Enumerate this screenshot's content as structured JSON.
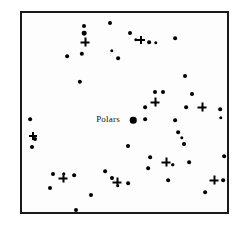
{
  "figure": {
    "background_color": "#ffffff",
    "frame_color": "#1a1a1a",
    "marker_color": "#000000"
  },
  "annotations": [
    {
      "text": "Polars",
      "x": 106,
      "y": 117
    }
  ],
  "chart_data": {
    "type": "scatter",
    "title": "",
    "subtitle": "",
    "xlabel": "",
    "ylabel": "",
    "grid": false,
    "legend_position": "none",
    "axis_ticks": false,
    "xlim": [
      0,
      209
    ],
    "ylim": [
      0,
      203
    ],
    "annotations": [
      {
        "text": "Polars",
        "x": 86,
        "y": 106,
        "target_x": 111,
        "target_y": 107
      }
    ],
    "series": [
      {
        "name": "dot-stars",
        "marker": "dot",
        "color": "#000000",
        "points": [
          {
            "x": 62,
            "y": 13,
            "size": 2.6
          },
          {
            "x": 62,
            "y": 20,
            "size": 3.0
          },
          {
            "x": 88,
            "y": 10,
            "size": 2.6
          },
          {
            "x": 108,
            "y": 20,
            "size": 2.6
          },
          {
            "x": 114,
            "y": 27,
            "size": 2.2
          },
          {
            "x": 127,
            "y": 29,
            "size": 2.4
          },
          {
            "x": 134,
            "y": 30,
            "size": 2.2
          },
          {
            "x": 153,
            "y": 25,
            "size": 2.4
          },
          {
            "x": 45,
            "y": 43,
            "size": 2.4
          },
          {
            "x": 60,
            "y": 41,
            "size": 2.8
          },
          {
            "x": 90,
            "y": 38,
            "size": 2.2
          },
          {
            "x": 96,
            "y": 45,
            "size": 2.4
          },
          {
            "x": 58,
            "y": 69,
            "size": 2.8
          },
          {
            "x": 163,
            "y": 63,
            "size": 2.6
          },
          {
            "x": 133,
            "y": 79,
            "size": 2.6
          },
          {
            "x": 141,
            "y": 79,
            "size": 2.6
          },
          {
            "x": 170,
            "y": 81,
            "size": 2.6
          },
          {
            "x": 8,
            "y": 106,
            "size": 2.4
          },
          {
            "x": 123,
            "y": 94,
            "size": 2.4
          },
          {
            "x": 164,
            "y": 94,
            "size": 2.4
          },
          {
            "x": 198,
            "y": 96,
            "size": 2.4
          },
          {
            "x": 111,
            "y": 107,
            "size": 4.2
          },
          {
            "x": 123,
            "y": 106,
            "size": 2.4
          },
          {
            "x": 199,
            "y": 105,
            "size": 2.2
          },
          {
            "x": 153,
            "y": 107,
            "size": 2.4
          },
          {
            "x": 13,
            "y": 126,
            "size": 2.6
          },
          {
            "x": 10,
            "y": 134,
            "size": 2.6
          },
          {
            "x": 156,
            "y": 119,
            "size": 2.4
          },
          {
            "x": 162,
            "y": 131,
            "size": 2.6
          },
          {
            "x": 106,
            "y": 133,
            "size": 2.6
          },
          {
            "x": 128,
            "y": 144,
            "size": 2.4
          },
          {
            "x": 151,
            "y": 152,
            "size": 2.2
          },
          {
            "x": 167,
            "y": 149,
            "size": 2.4
          },
          {
            "x": 202,
            "y": 143,
            "size": 2.4
          },
          {
            "x": 31,
            "y": 161,
            "size": 2.6
          },
          {
            "x": 42,
            "y": 161,
            "size": 2.2
          },
          {
            "x": 52,
            "y": 162,
            "size": 2.4
          },
          {
            "x": 28,
            "y": 175,
            "size": 2.6
          },
          {
            "x": 83,
            "y": 158,
            "size": 2.4
          },
          {
            "x": 90,
            "y": 165,
            "size": 2.6
          },
          {
            "x": 96,
            "y": 173,
            "size": 2.2
          },
          {
            "x": 106,
            "y": 170,
            "size": 2.4
          },
          {
            "x": 126,
            "y": 155,
            "size": 2.4
          },
          {
            "x": 146,
            "y": 167,
            "size": 2.4
          },
          {
            "x": 151,
            "y": 152,
            "size": 2.2
          },
          {
            "x": 201,
            "y": 167,
            "size": 2.4
          },
          {
            "x": 183,
            "y": 179,
            "size": 2.4
          },
          {
            "x": 69,
            "y": 182,
            "size": 2.6
          },
          {
            "x": 54,
            "y": 197,
            "size": 2.6
          },
          {
            "x": 160,
            "y": 125,
            "size": 2.2
          }
        ]
      },
      {
        "name": "cross-stars",
        "marker": "plus",
        "color": "#000000",
        "points": [
          {
            "x": 63,
            "y": 29,
            "size": 9
          },
          {
            "x": 119,
            "y": 27,
            "size": 8
          },
          {
            "x": 133,
            "y": 89,
            "size": 9
          },
          {
            "x": 180,
            "y": 94,
            "size": 9
          },
          {
            "x": 11,
            "y": 123,
            "size": 8
          },
          {
            "x": 41,
            "y": 165,
            "size": 9
          },
          {
            "x": 95,
            "y": 169,
            "size": 9
          },
          {
            "x": 144,
            "y": 149,
            "size": 9
          },
          {
            "x": 192,
            "y": 167,
            "size": 9
          }
        ]
      }
    ]
  }
}
